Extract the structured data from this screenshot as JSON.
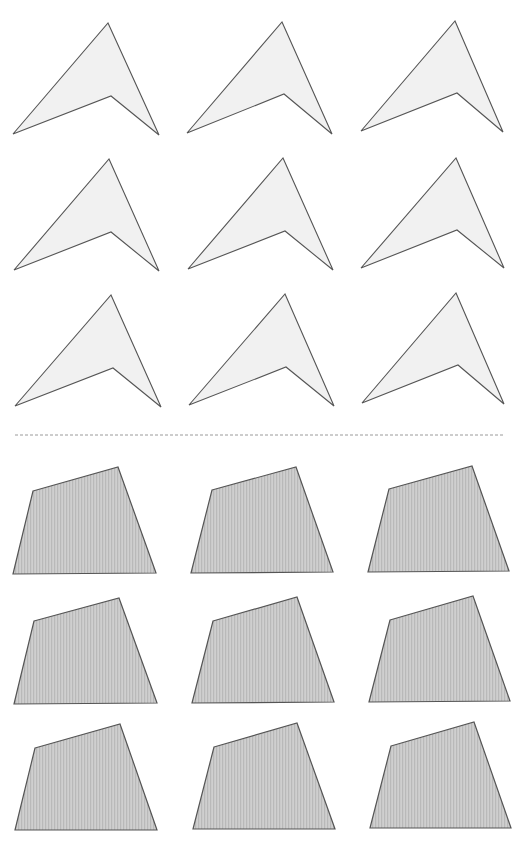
{
  "page": {
    "width": 524,
    "height": 842,
    "background": "#ffffff"
  },
  "colors": {
    "arrow_fill": "#f1f1f1",
    "arrow_stroke": "#555555",
    "quad_fill_base": "#cfcfcf",
    "quad_stripe": "#b9b9b9",
    "quad_stroke": "#555555",
    "divider": "#9a9a9a"
  },
  "divider": {
    "x1": 15,
    "y1": 435,
    "x2": 505,
    "y2": 435,
    "dash": "3,2"
  },
  "top_section": {
    "shape": "arrowhead",
    "items": [
      {
        "row": 1,
        "col": 1,
        "points": [
          [
            108,
            23
          ],
          [
            159,
            135
          ],
          [
            111,
            96
          ],
          [
            13,
            134
          ]
        ]
      },
      {
        "row": 1,
        "col": 2,
        "points": [
          [
            282,
            22
          ],
          [
            332,
            134
          ],
          [
            284,
            94
          ],
          [
            187,
            133
          ]
        ]
      },
      {
        "row": 1,
        "col": 3,
        "points": [
          [
            455,
            21
          ],
          [
            503,
            132
          ],
          [
            457,
            93
          ],
          [
            361,
            131
          ]
        ]
      },
      {
        "row": 2,
        "col": 1,
        "points": [
          [
            109,
            159
          ],
          [
            159,
            271
          ],
          [
            111,
            232
          ],
          [
            14,
            270
          ]
        ]
      },
      {
        "row": 2,
        "col": 2,
        "points": [
          [
            283,
            158
          ],
          [
            333,
            270
          ],
          [
            285,
            231
          ],
          [
            188,
            269
          ]
        ]
      },
      {
        "row": 2,
        "col": 3,
        "points": [
          [
            456,
            158
          ],
          [
            504,
            268
          ],
          [
            457,
            230
          ],
          [
            361,
            268
          ]
        ]
      },
      {
        "row": 3,
        "col": 1,
        "points": [
          [
            111,
            295
          ],
          [
            161,
            407
          ],
          [
            113,
            368
          ],
          [
            15,
            406
          ]
        ]
      },
      {
        "row": 3,
        "col": 2,
        "points": [
          [
            285,
            294
          ],
          [
            334,
            406
          ],
          [
            286,
            367
          ],
          [
            189,
            405
          ]
        ]
      },
      {
        "row": 3,
        "col": 3,
        "points": [
          [
            456,
            293
          ],
          [
            504,
            404
          ],
          [
            458,
            365
          ],
          [
            362,
            403
          ]
        ]
      }
    ]
  },
  "bottom_section": {
    "shape": "quadrilateral",
    "items": [
      {
        "row": 1,
        "col": 1,
        "points": [
          [
            33,
            491
          ],
          [
            118,
            467
          ],
          [
            156,
            573
          ],
          [
            13,
            574
          ]
        ]
      },
      {
        "row": 1,
        "col": 2,
        "points": [
          [
            212,
            490
          ],
          [
            296,
            467
          ],
          [
            333,
            572
          ],
          [
            191,
            573
          ]
        ]
      },
      {
        "row": 1,
        "col": 3,
        "points": [
          [
            389,
            489
          ],
          [
            472,
            466
          ],
          [
            509,
            571
          ],
          [
            368,
            572
          ]
        ]
      },
      {
        "row": 2,
        "col": 1,
        "points": [
          [
            34,
            621
          ],
          [
            119,
            598
          ],
          [
            157,
            703
          ],
          [
            14,
            704
          ]
        ]
      },
      {
        "row": 2,
        "col": 2,
        "points": [
          [
            213,
            621
          ],
          [
            297,
            597
          ],
          [
            334,
            702
          ],
          [
            192,
            703
          ]
        ]
      },
      {
        "row": 2,
        "col": 3,
        "points": [
          [
            390,
            620
          ],
          [
            473,
            596
          ],
          [
            510,
            701
          ],
          [
            369,
            702
          ]
        ]
      },
      {
        "row": 3,
        "col": 1,
        "points": [
          [
            35,
            748
          ],
          [
            120,
            724
          ],
          [
            157,
            830
          ],
          [
            15,
            830
          ]
        ]
      },
      {
        "row": 3,
        "col": 2,
        "points": [
          [
            214,
            747
          ],
          [
            297,
            723
          ],
          [
            335,
            829
          ],
          [
            193,
            829
          ]
        ]
      },
      {
        "row": 3,
        "col": 3,
        "points": [
          [
            391,
            746
          ],
          [
            474,
            722
          ],
          [
            511,
            828
          ],
          [
            370,
            828
          ]
        ]
      }
    ]
  }
}
